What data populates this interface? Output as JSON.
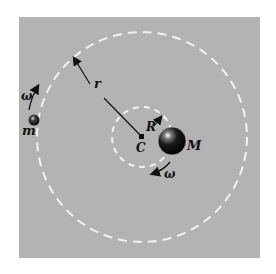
{
  "diagram": {
    "labels": {
      "small_mass": "m",
      "large_mass": "M",
      "center": "C",
      "outer_radius": "r",
      "inner_radius": "R",
      "angular_velocity_small": "ω",
      "angular_velocity_large": "ω"
    },
    "colors": {
      "background": "#ffffff",
      "panel": "#b3b3b3",
      "dashed_orbit": "#f2f2f2",
      "ink": "#111111"
    },
    "geometry": {
      "center": [
        142,
        137
      ],
      "outer_orbit_radius": 105,
      "inner_orbit_radius": 30
    }
  }
}
